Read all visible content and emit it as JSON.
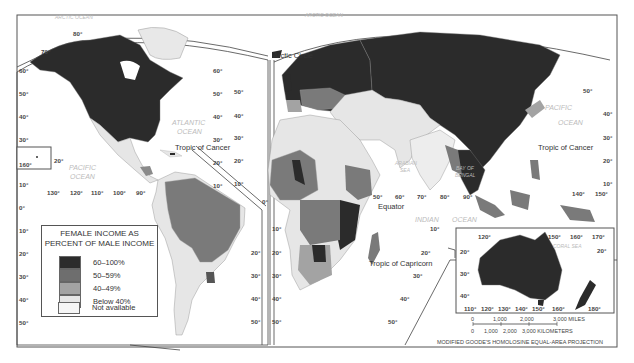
{
  "legend": {
    "title_line1": "FEMALE INCOME AS",
    "title_line2": "PERCENT OF MALE INCOME",
    "items": [
      {
        "label": "60–100%",
        "color": "#2b2b2b"
      },
      {
        "label": "50–59%",
        "color": "#6e6e6e"
      },
      {
        "label": "40–49%",
        "color": "#a3a3a3"
      },
      {
        "label": "Below 40%",
        "color": "#e6e6e6"
      },
      {
        "label": "Not available",
        "color": "#f6f6f6"
      }
    ]
  },
  "oceans": {
    "arctic_left": "ARCTIC OCEAN",
    "arctic_right": "ARCTIC OCEAN",
    "atlantic_1": "ATLANTIC",
    "atlantic_2": "OCEAN",
    "pacific_left_1": "PACIFIC",
    "pacific_left_2": "OCEAN",
    "pacific_right_1": "PACIFIC",
    "pacific_right_2": "OCEAN",
    "indian_1": "INDIAN",
    "indian_2": "OCEAN",
    "arabian_sea_1": "ARABIAN",
    "arabian_sea_2": "SEA",
    "bay_of_bengal_1": "BAY OF",
    "bay_of_bengal_2": "BENGAL",
    "coral_sea": "CORAL SEA"
  },
  "lines": {
    "arctic_circle": "Arctic Circle",
    "tropic_cancer_left": "Tropic of Cancer",
    "tropic_cancer_right": "Tropic of Cancer",
    "equator": "Equator",
    "tropic_capricorn": "Tropic of Capricorn"
  },
  "degrees": {
    "left_lat": [
      "60°",
      "50°",
      "40°",
      "30°",
      "20°",
      "10°",
      "0°",
      "10°",
      "20°",
      "30°",
      "40°",
      "50°"
    ],
    "na_top": [
      "80°",
      "70°"
    ],
    "na_right_lat": [
      "60°",
      "50°",
      "40°",
      "30°",
      "20°",
      "10°"
    ],
    "na_lon": [
      "130°",
      "120°",
      "110°",
      "100°",
      "90°"
    ],
    "hawaii_lon": "160°",
    "hawaii_lat": "20°",
    "sa_right_lat": [
      "20°",
      "30°",
      "40°",
      "50°"
    ],
    "sa_zero": "0°",
    "eur_left_lat": [
      "50°",
      "40°",
      "30°",
      "20°",
      "10°"
    ],
    "af_left_lat": [
      "10°",
      "20°",
      "30°",
      "40°",
      "50°"
    ],
    "eq_lon": [
      "50°",
      "60°",
      "70°",
      "80°"
    ],
    "asia_lon": [
      "90°"
    ],
    "indian_lat": [
      "10°",
      "20°",
      "30°",
      "40°",
      "50°"
    ],
    "right_lat": [
      "50°",
      "40°",
      "30°",
      "20°",
      "10°"
    ],
    "pac_lon": [
      "140°",
      "150°"
    ],
    "aus_top": [
      "120°",
      "150°",
      "160°",
      "170°"
    ],
    "aus_lat": [
      "20°",
      "30°",
      "40°"
    ],
    "aus_lat_right": "20°",
    "aus_bottom": [
      "110°",
      "120°",
      "130°",
      "140°",
      "150°",
      "160°",
      "180°"
    ]
  },
  "scale": {
    "miles_ticks": [
      "0",
      "1,000",
      "2,000",
      "3,000 MILES"
    ],
    "km_ticks": [
      "0",
      "1,000",
      "2,000",
      "3,000 KILOMETERS"
    ],
    "projection": "MODIFIED GOODE'S HOMOLOSINE EQUAL-AREA PROJECTION"
  }
}
